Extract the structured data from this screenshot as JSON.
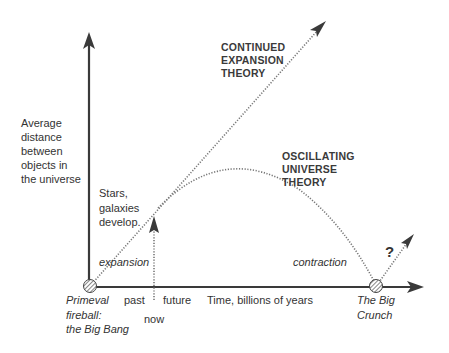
{
  "diagram": {
    "y_axis_label": [
      "Average",
      "distance",
      "between",
      "objects in",
      "the universe"
    ],
    "x_axis_label": "Time, billions of years",
    "origin_label": [
      "Primeval",
      "fireball:",
      "the Big Bang"
    ],
    "end_label": [
      "The Big",
      "Crunch"
    ],
    "past_label": "past",
    "future_label": "future",
    "now_label": "now",
    "stars_label": [
      "Stars,",
      "galaxies",
      "develop."
    ],
    "expansion_label": "expansion",
    "contraction_label": "contraction",
    "continued_theory": [
      "CONTINUED",
      "EXPANSION",
      "THEORY"
    ],
    "oscillating_theory": [
      "OSCILLATING",
      "UNIVERSE",
      "THEORY"
    ],
    "question_mark": "?"
  },
  "colors": {
    "axis": "#3a3a3a",
    "dotted": "#777777",
    "text": "#333333"
  }
}
